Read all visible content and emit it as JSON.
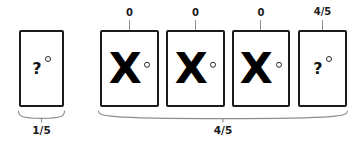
{
  "diagram": {
    "colors": {
      "card_border": "#1b1b1b",
      "card_fill": "#ffffff",
      "glyph": "#000000",
      "bracket": "#8d8d8d",
      "label": "#1a1a1a",
      "background": "#ffffff"
    },
    "groups": [
      {
        "name": "left-group",
        "bottom_label": "1/5",
        "cards": [
          {
            "name": "card-question-1",
            "glyph": "?",
            "glyph_type": "question",
            "ring": true,
            "top_label": null
          }
        ]
      },
      {
        "name": "right-group",
        "bottom_label": "4/5",
        "cards": [
          {
            "name": "card-x-1",
            "glyph": "X",
            "glyph_type": "cross",
            "ring": true,
            "top_label": "0"
          },
          {
            "name": "card-x-2",
            "glyph": "X",
            "glyph_type": "cross",
            "ring": true,
            "top_label": "0"
          },
          {
            "name": "card-x-3",
            "glyph": "X",
            "glyph_type": "cross",
            "ring": true,
            "top_label": "0"
          },
          {
            "name": "card-question-2",
            "glyph": "?",
            "glyph_type": "question",
            "ring": true,
            "top_label": "4/5"
          }
        ]
      }
    ],
    "top_labels": [
      "0",
      "0",
      "0",
      "4/5"
    ],
    "bottom_labels": [
      "1/5",
      "4/5"
    ]
  }
}
